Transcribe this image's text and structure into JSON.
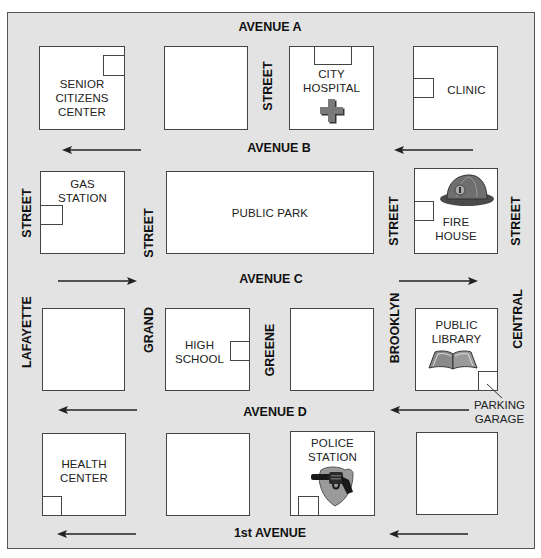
{
  "avenues": {
    "a": "AVENUE A",
    "b": "AVENUE B",
    "c": "AVENUE C",
    "d": "AVENUE D",
    "first": "1st AVENUE"
  },
  "streets": {
    "lafayette": "LAFAYETTE",
    "grand": "GRAND",
    "greene": "GREENE",
    "brooklyn": "BROOKLYN",
    "central": "CENTRAL",
    "street": "STREET"
  },
  "blocks": {
    "senior": "SENIOR CITIZENS CENTER",
    "senior_lines": [
      "SENIOR",
      "CITIZENS",
      "CENTER"
    ],
    "hospital_lines": [
      "CITY",
      "HOSPITAL"
    ],
    "clinic": "CLINIC",
    "gas_lines": [
      "GAS",
      "STATION"
    ],
    "park": "PUBLIC PARK",
    "fire_lines": [
      "FIRE",
      "HOUSE"
    ],
    "school_lines": [
      "HIGH",
      "SCHOOL"
    ],
    "library_lines": [
      "PUBLIC",
      "LIBRARY"
    ],
    "health_lines": [
      "HEALTH",
      "CENTER"
    ],
    "police_lines": [
      "POLICE",
      "STATION"
    ]
  },
  "callouts": {
    "parking_lines": [
      "PARKING",
      "GARAGE"
    ]
  },
  "icons": {
    "hospital": "cross-icon",
    "fire": "fire-helmet-icon",
    "library": "open-book-icon",
    "police": "badge-revolver-icon"
  },
  "traffic": {
    "avenue_b": "westbound",
    "avenue_c": "eastbound",
    "avenue_d": "westbound",
    "first_avenue": "westbound"
  },
  "colors": {
    "background": "#e3e3e3",
    "block": "#ffffff",
    "border": "#444444",
    "icon_gray": "#7a7a7a"
  }
}
